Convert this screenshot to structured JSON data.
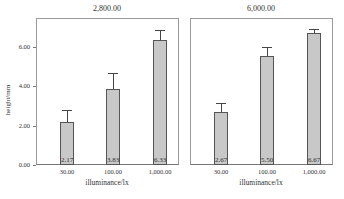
{
  "chart_data": {
    "type": "bar",
    "ylabel": "height/mm",
    "xlabel": "illuminance/lx",
    "ylim": [
      0,
      7.4
    ],
    "yticks": [
      "0.00",
      "2.00",
      "4.00",
      "6.00"
    ],
    "categories": [
      "30.00",
      "100.00",
      "1,000.00"
    ],
    "panels": [
      {
        "title": "2,800.00",
        "values": [
          2.17,
          3.83,
          6.33
        ],
        "labels": [
          "2.17",
          "3.83",
          "6.33"
        ],
        "error_upper": [
          2.8,
          4.65,
          6.85
        ]
      },
      {
        "title": "6,000.00",
        "values": [
          2.67,
          5.5,
          6.67
        ],
        "labels": [
          "2.67",
          "5.50",
          "6.67"
        ],
        "error_upper": [
          3.15,
          5.95,
          6.87
        ]
      }
    ],
    "bar_color": "#c8c8c8"
  }
}
